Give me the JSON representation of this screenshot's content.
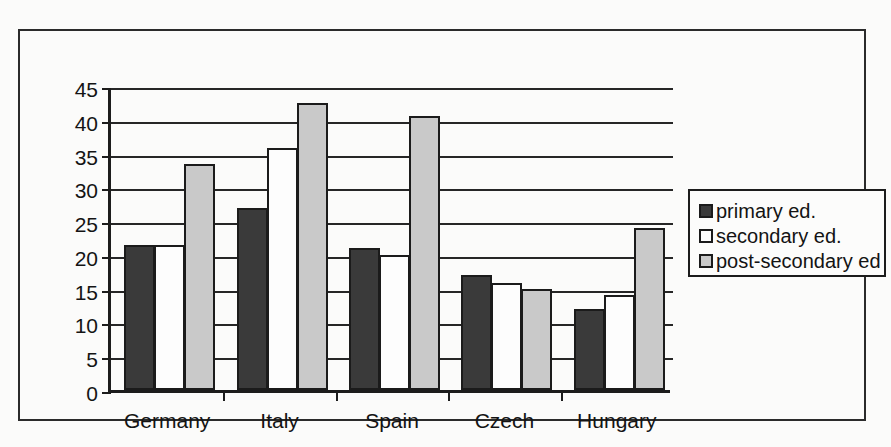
{
  "chart_data": {
    "type": "bar",
    "title": "",
    "xlabel": "",
    "ylabel": "",
    "ylim": [
      0,
      45
    ],
    "yticks": [
      0,
      5,
      10,
      15,
      20,
      25,
      30,
      35,
      40,
      45
    ],
    "grid": true,
    "legend_position": "right",
    "categories": [
      "Germany",
      "Italy",
      "Spain",
      "Czech",
      "Hungary"
    ],
    "series": [
      {
        "name": "primary ed.",
        "color": "#3a3a3a",
        "values": [
          21.5,
          27.0,
          21.0,
          17.0,
          12.0
        ]
      },
      {
        "name": "secondary ed.",
        "color": "#fdfdfd",
        "values": [
          21.5,
          35.8,
          20.0,
          15.8,
          14.0
        ]
      },
      {
        "name": "post-secondary ed",
        "color": "#c9c9c9",
        "values": [
          33.5,
          42.5,
          40.5,
          15.0,
          24.0
        ]
      }
    ]
  },
  "legend": {
    "items": [
      {
        "label": "primary ed.",
        "swatch": "dark-gray-square-icon"
      },
      {
        "label": "secondary ed.",
        "swatch": "white-square-icon"
      },
      {
        "label": "post-secondary ed",
        "swatch": "light-gray-square-icon"
      }
    ]
  },
  "axis": {
    "y_tick_labels": [
      "45",
      "40",
      "35",
      "30",
      "25",
      "20",
      "15",
      "10",
      "5",
      "0"
    ],
    "x_tick_labels": [
      "Germany",
      "Italy",
      "Spain",
      "Czech",
      "Hungary"
    ]
  }
}
